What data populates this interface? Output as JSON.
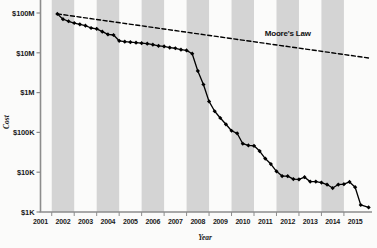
{
  "chart_data": {
    "type": "line",
    "title": "",
    "xlabel": "Year",
    "ylabel": "Cost",
    "x_tick_labels": [
      "2001",
      "2002",
      "2003",
      "2004",
      "2005",
      "2006",
      "2007",
      "2008",
      "2009",
      "2010",
      "2011",
      "2012",
      "2013",
      "2014",
      "2015"
    ],
    "y_tick_labels": [
      "$100M",
      "$10M",
      "$1M",
      "$100K",
      "$10K",
      "$1K"
    ],
    "y_tick_values": [
      100000000,
      10000000,
      1000000,
      100000,
      10000,
      1000
    ],
    "ylim": [
      1000,
      100000000
    ],
    "xlim": [
      2001,
      2015.75
    ],
    "y_scale": "log",
    "grid": false,
    "legend_position": "inline-annotation",
    "banding": {
      "note": "alternating vertical grey bands, one per year starting 2002",
      "color": "#d4d4d4",
      "banded_years": [
        "2002",
        "2004",
        "2006",
        "2008",
        "2010",
        "2012",
        "2014"
      ]
    },
    "series": [
      {
        "name": "Cost per Genome",
        "style": "solid-with-markers",
        "color": "#000000",
        "marker": "diamond",
        "points": [
          {
            "x": 2001.75,
            "y": 95000000
          },
          {
            "x": 2002.0,
            "y": 70000000
          },
          {
            "x": 2002.25,
            "y": 62000000
          },
          {
            "x": 2002.5,
            "y": 56000000
          },
          {
            "x": 2002.75,
            "y": 52000000
          },
          {
            "x": 2003.0,
            "y": 48000000
          },
          {
            "x": 2003.25,
            "y": 42000000
          },
          {
            "x": 2003.5,
            "y": 40000000
          },
          {
            "x": 2003.75,
            "y": 34000000
          },
          {
            "x": 2004.0,
            "y": 29000000
          },
          {
            "x": 2004.25,
            "y": 28000000
          },
          {
            "x": 2004.5,
            "y": 20000000
          },
          {
            "x": 2004.75,
            "y": 19000000
          },
          {
            "x": 2005.0,
            "y": 18500000
          },
          {
            "x": 2005.25,
            "y": 18000000
          },
          {
            "x": 2005.5,
            "y": 17500000
          },
          {
            "x": 2005.75,
            "y": 17000000
          },
          {
            "x": 2006.0,
            "y": 16000000
          },
          {
            "x": 2006.25,
            "y": 15000000
          },
          {
            "x": 2006.5,
            "y": 14500000
          },
          {
            "x": 2006.75,
            "y": 13500000
          },
          {
            "x": 2007.0,
            "y": 13000000
          },
          {
            "x": 2007.25,
            "y": 12000000
          },
          {
            "x": 2007.5,
            "y": 11500000
          },
          {
            "x": 2007.75,
            "y": 9500000
          },
          {
            "x": 2008.0,
            "y": 3500000
          },
          {
            "x": 2008.25,
            "y": 1600000
          },
          {
            "x": 2008.5,
            "y": 600000
          },
          {
            "x": 2008.75,
            "y": 340000
          },
          {
            "x": 2009.0,
            "y": 230000
          },
          {
            "x": 2009.25,
            "y": 160000
          },
          {
            "x": 2009.5,
            "y": 110000
          },
          {
            "x": 2009.75,
            "y": 95000
          },
          {
            "x": 2010.0,
            "y": 52000
          },
          {
            "x": 2010.25,
            "y": 47000
          },
          {
            "x": 2010.5,
            "y": 46000
          },
          {
            "x": 2010.75,
            "y": 34000
          },
          {
            "x": 2011.0,
            "y": 22000
          },
          {
            "x": 2011.25,
            "y": 16000
          },
          {
            "x": 2011.5,
            "y": 10500
          },
          {
            "x": 2011.75,
            "y": 8000
          },
          {
            "x": 2012.0,
            "y": 7950
          },
          {
            "x": 2012.25,
            "y": 6700
          },
          {
            "x": 2012.5,
            "y": 6600
          },
          {
            "x": 2012.75,
            "y": 7500
          },
          {
            "x": 2013.0,
            "y": 5800
          },
          {
            "x": 2013.25,
            "y": 5800
          },
          {
            "x": 2013.5,
            "y": 5500
          },
          {
            "x": 2013.75,
            "y": 4900
          },
          {
            "x": 2014.0,
            "y": 4000
          },
          {
            "x": 2014.25,
            "y": 4900
          },
          {
            "x": 2014.5,
            "y": 5000
          },
          {
            "x": 2014.75,
            "y": 5700
          },
          {
            "x": 2015.0,
            "y": 4200
          },
          {
            "x": 2015.25,
            "y": 1500
          },
          {
            "x": 2015.6,
            "y": 1300
          }
        ]
      },
      {
        "name": "Moore's Law",
        "style": "dashed",
        "color": "#000000",
        "marker": "none",
        "points": [
          {
            "x": 2001.75,
            "y": 95000000
          },
          {
            "x": 2015.6,
            "y": 7400000
          }
        ]
      }
    ],
    "annotations": [
      {
        "name": "moores-law-label",
        "text": "Moore's Law",
        "x": 2012.0,
        "y": 26000000
      }
    ]
  },
  "axes": {
    "y_title": "Cost",
    "x_title": "Year",
    "axis_color": "#8d8d8d",
    "tick_color": "#8d8d8d"
  }
}
